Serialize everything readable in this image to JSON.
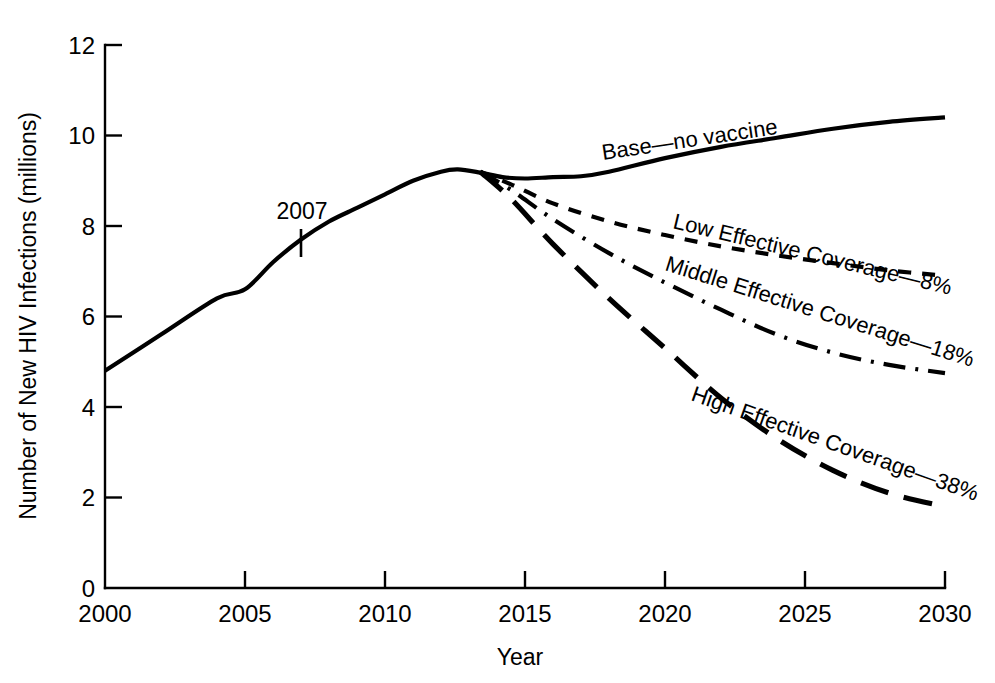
{
  "chart_data": {
    "type": "line",
    "title": "",
    "xlabel": "Year",
    "ylabel": "Number of New HIV Infections (millions)",
    "xlim": [
      2000,
      2030
    ],
    "ylim": [
      0,
      12
    ],
    "xticks": [
      "2000",
      "2005",
      "2010",
      "2015",
      "2020",
      "2025",
      "2030"
    ],
    "yticks": [
      "0",
      "2",
      "4",
      "6",
      "8",
      "10",
      "12"
    ],
    "grid": false,
    "legend_position": "inline-on-curve",
    "annotations": [
      {
        "text": "2007",
        "x": 2007,
        "y": 7.7
      }
    ],
    "series": [
      {
        "name": "Base—no vaccine",
        "label": "Base—no vaccine",
        "linestyle": "solid",
        "x": [
          2000,
          2002,
          2004,
          2005,
          2006,
          2007,
          2008,
          2009,
          2010,
          2011,
          2012,
          2012.6,
          2013.4,
          2014.2,
          2015,
          2016,
          2017,
          2018,
          2020,
          2022,
          2024,
          2026,
          2028,
          2030
        ],
        "values": [
          4.8,
          5.6,
          6.4,
          6.6,
          7.2,
          7.7,
          8.1,
          8.4,
          8.7,
          9.0,
          9.2,
          9.25,
          9.18,
          9.08,
          9.05,
          9.08,
          9.1,
          9.2,
          9.5,
          9.75,
          9.95,
          10.15,
          10.3,
          10.4
        ]
      },
      {
        "name": "Low Effective Coverage—8%",
        "label": "Low Effective Coverage—8%",
        "linestyle": "dashed",
        "x": [
          2013.4,
          2014.5,
          2016,
          2018,
          2020,
          2022,
          2024,
          2026,
          2028,
          2030
        ],
        "values": [
          9.2,
          8.92,
          8.5,
          8.1,
          7.8,
          7.55,
          7.35,
          7.18,
          7.02,
          6.9
        ]
      },
      {
        "name": "Middle Effective Coverage—18%",
        "label": "Middle Effective Coverage—18%",
        "linestyle": "dashdot",
        "x": [
          2013.4,
          2014.5,
          2016,
          2018,
          2020,
          2022,
          2024,
          2026,
          2028,
          2030
        ],
        "values": [
          9.2,
          8.8,
          8.15,
          7.4,
          6.75,
          6.15,
          5.6,
          5.2,
          4.93,
          4.75
        ]
      },
      {
        "name": "High Effective Coverage—38%",
        "label": "High Effective Coverage—38%",
        "linestyle": "longdash",
        "x": [
          2013.4,
          2014.5,
          2016,
          2018,
          2020,
          2022,
          2024,
          2026,
          2028,
          2030
        ],
        "values": [
          9.2,
          8.6,
          7.6,
          6.4,
          5.3,
          4.2,
          3.3,
          2.6,
          2.1,
          1.8
        ]
      }
    ]
  },
  "axes": {
    "y_title": "Number of New HIV Infections (millions)",
    "x_title": "Year",
    "x_tick_labels": {
      "t0": "2000",
      "t1": "2005",
      "t2": "2010",
      "t3": "2015",
      "t4": "2020",
      "t5": "2025",
      "t6": "2030"
    },
    "y_tick_labels": {
      "t0": "0",
      "t1": "2",
      "t2": "4",
      "t3": "6",
      "t4": "8",
      "t5": "10",
      "t6": "12"
    }
  },
  "series_labels": {
    "base": "Base—no vaccine",
    "low": "Low Effective Coverage—8%",
    "middle": "Middle Effective Coverage—18%",
    "high": "High Effective Coverage—38%"
  },
  "annotation": {
    "year_2007": "2007"
  },
  "colors": {
    "line": "#000000",
    "background": "#ffffff",
    "text": "#000000"
  }
}
